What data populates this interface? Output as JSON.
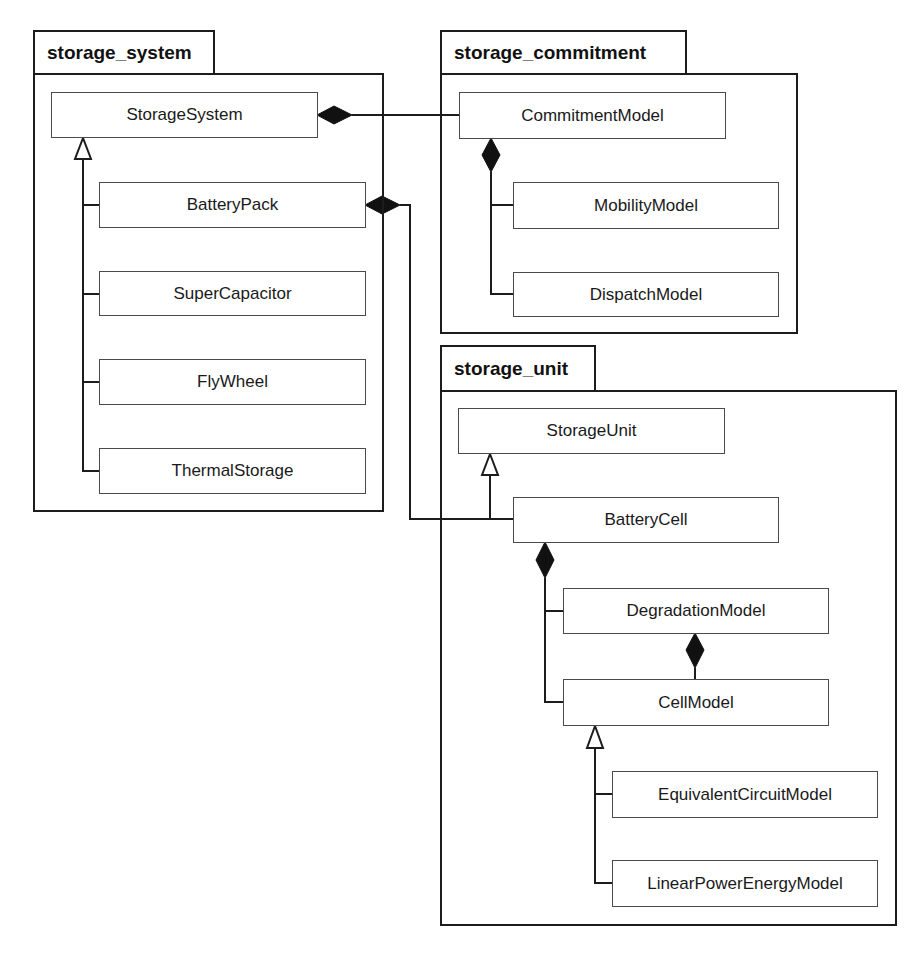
{
  "diagram": {
    "type": "UML class/package diagram",
    "packages": [
      {
        "id": "storage_system",
        "label": "storage_system",
        "classes": [
          "StorageSystem",
          "BatteryPack",
          "SuperCapacitor",
          "FlyWheel",
          "ThermalStorage"
        ]
      },
      {
        "id": "storage_commitment",
        "label": "storage_commitment",
        "classes": [
          "CommitmentModel",
          "MobilityModel",
          "DispatchModel"
        ]
      },
      {
        "id": "storage_unit",
        "label": "storage_unit",
        "classes": [
          "StorageUnit",
          "BatteryCell",
          "DegradationModel",
          "CellModel",
          "EquivalentCircuitModel",
          "LinearPowerEnergyModel"
        ]
      }
    ],
    "classes": {
      "storage_system": {
        "storage_system_class": "StorageSystem",
        "battery_pack": "BatteryPack",
        "super_capacitor": "SuperCapacitor",
        "fly_wheel": "FlyWheel",
        "thermal_storage": "ThermalStorage"
      },
      "storage_commitment": {
        "commitment_model": "CommitmentModel",
        "mobility_model": "MobilityModel",
        "dispatch_model": "DispatchModel"
      },
      "storage_unit": {
        "storage_unit_class": "StorageUnit",
        "battery_cell": "BatteryCell",
        "degradation_model": "DegradationModel",
        "cell_model": "CellModel",
        "equivalent_circuit_model": "EquivalentCircuitModel",
        "linear_power_energy_model": "LinearPowerEnergyModel"
      }
    },
    "relationships": [
      {
        "type": "generalization",
        "from": "BatteryPack",
        "to": "StorageSystem"
      },
      {
        "type": "generalization",
        "from": "SuperCapacitor",
        "to": "StorageSystem"
      },
      {
        "type": "generalization",
        "from": "FlyWheel",
        "to": "StorageSystem"
      },
      {
        "type": "generalization",
        "from": "ThermalStorage",
        "to": "StorageSystem"
      },
      {
        "type": "composition",
        "whole": "StorageSystem",
        "part": "CommitmentModel"
      },
      {
        "type": "composition",
        "whole": "CommitmentModel",
        "part": "MobilityModel"
      },
      {
        "type": "composition",
        "whole": "CommitmentModel",
        "part": "DispatchModel"
      },
      {
        "type": "composition",
        "whole": "BatteryPack",
        "part": "BatteryCell"
      },
      {
        "type": "generalization",
        "from": "BatteryCell",
        "to": "StorageUnit"
      },
      {
        "type": "composition",
        "whole": "BatteryCell",
        "part": "DegradationModel"
      },
      {
        "type": "composition",
        "whole": "BatteryCell",
        "part": "CellModel"
      },
      {
        "type": "composition",
        "whole": "DegradationModel",
        "part": "CellModel"
      },
      {
        "type": "generalization",
        "from": "EquivalentCircuitModel",
        "to": "CellModel"
      },
      {
        "type": "generalization",
        "from": "LinearPowerEnergyModel",
        "to": "CellModel"
      }
    ],
    "colors": {
      "line": "#1c1c1c",
      "box_border": "#4a4a4a",
      "background": "#ffffff",
      "diamond_fill": "#111111"
    }
  }
}
